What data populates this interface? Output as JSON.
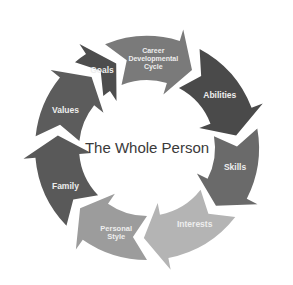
{
  "diagram": {
    "title": "The Whole Person",
    "center": {
      "x": 147,
      "y": 148
    },
    "outer_radius": 112,
    "inner_radius": 68,
    "segments": [
      {
        "label_lines": [
          "Career",
          "Developmental",
          "Cycle"
        ],
        "color": "#7a7a7a",
        "start": -112,
        "end": -62,
        "label_angle": -86,
        "font_size": 7
      },
      {
        "label_lines": [
          "Abilities"
        ],
        "color": "#4a4a4a",
        "start": -62,
        "end": -10,
        "label_angle": -36,
        "font_size": 8.5
      },
      {
        "label_lines": [
          "Skills"
        ],
        "color": "#6a6a6a",
        "start": -10,
        "end": 38,
        "label_angle": 12,
        "font_size": 8.5
      },
      {
        "label_lines": [
          "Interests"
        ],
        "color": "#b4b4b4",
        "start": 38,
        "end": 90,
        "label_angle": 58,
        "font_size": 8.5
      },
      {
        "label_lines": [
          "Personal",
          "Style"
        ],
        "color": "#9c9c9c",
        "start": 90,
        "end": 136,
        "label_angle": 110,
        "font_size": 7.5
      },
      {
        "label_lines": [
          "Family"
        ],
        "color": "#595959",
        "start": 136,
        "end": 186,
        "label_angle": 155,
        "font_size": 8.5
      },
      {
        "label_lines": [
          "Values"
        ],
        "color": "#5c5c5c",
        "start": 186,
        "end": 230,
        "label_angle": 205,
        "font_size": 8.5
      },
      {
        "label_lines": [
          "Goals"
        ],
        "color": "#4d4d4d",
        "start": 230,
        "end": 248,
        "label_angle": 240,
        "font_size": 8.5
      }
    ]
  }
}
